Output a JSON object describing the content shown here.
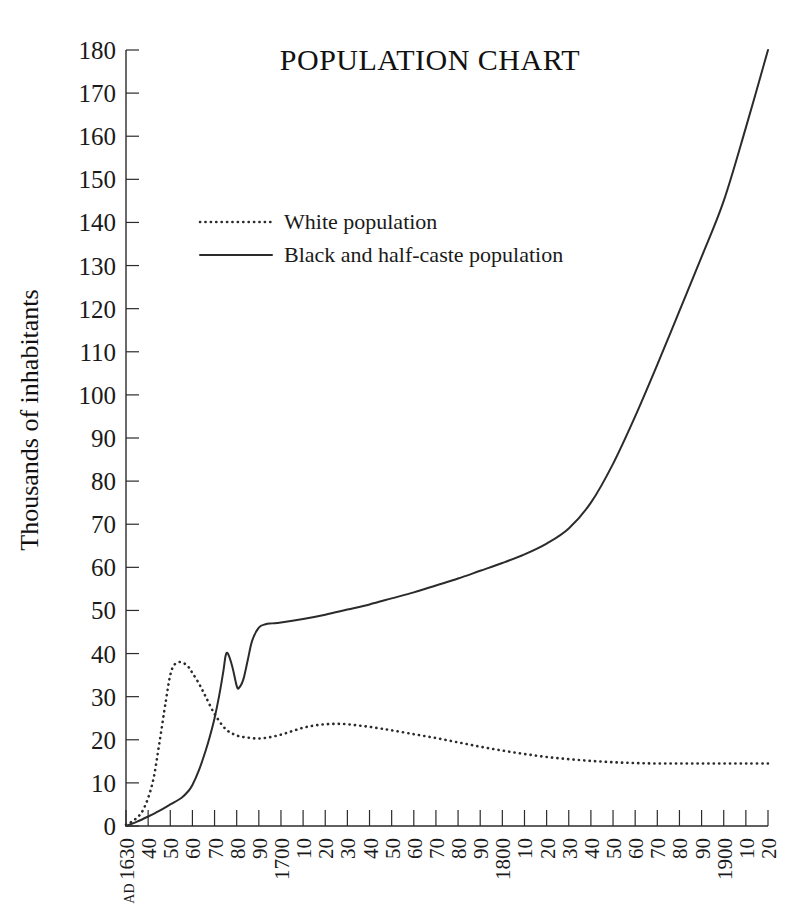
{
  "chart_data": {
    "type": "line",
    "title": "POPULATION CHART",
    "xlabel": "",
    "ylabel": "Thousands of inhabitants",
    "ylim": [
      0,
      180
    ],
    "xlim": [
      1630,
      1920
    ],
    "ytick_step": 10,
    "xtick_step": 10,
    "grid": false,
    "legend_position": "upper-left-inside",
    "yticks": [
      0,
      10,
      20,
      30,
      40,
      50,
      60,
      70,
      80,
      90,
      100,
      110,
      120,
      130,
      140,
      150,
      160,
      170,
      180
    ],
    "xticks": [
      1630,
      1640,
      1650,
      1660,
      1670,
      1680,
      1690,
      1700,
      1710,
      1720,
      1730,
      1740,
      1750,
      1760,
      1770,
      1780,
      1790,
      1800,
      1810,
      1820,
      1830,
      1840,
      1850,
      1860,
      1870,
      1880,
      1890,
      1900,
      1910,
      1920
    ],
    "xtick_labels": [
      "AD 1630",
      "40",
      "50",
      "60",
      "70",
      "80",
      "90",
      "1700",
      "10",
      "20",
      "30",
      "40",
      "50",
      "60",
      "70",
      "80",
      "90",
      "1800",
      "10",
      "20",
      "30",
      "40",
      "50",
      "60",
      "70",
      "80",
      "90",
      "1900",
      "10",
      "20"
    ],
    "series": [
      {
        "name": "White population",
        "style": "dotted",
        "color": "#2b2b2b",
        "x": [
          1630,
          1634,
          1638,
          1642,
          1645,
          1648,
          1650,
          1652,
          1655,
          1658,
          1660,
          1663,
          1666,
          1670,
          1675,
          1680,
          1685,
          1690,
          1695,
          1700,
          1705,
          1710,
          1715,
          1720,
          1725,
          1730,
          1735,
          1740,
          1745,
          1750,
          1760,
          1770,
          1780,
          1790,
          1800,
          1810,
          1820,
          1830,
          1840,
          1850,
          1860,
          1870,
          1880,
          1890,
          1900,
          1910,
          1920
        ],
        "y": [
          0.3,
          1.5,
          4.0,
          10.0,
          19.0,
          29.0,
          35.0,
          37.5,
          38.0,
          37.0,
          35.5,
          33.0,
          30.0,
          26.0,
          22.5,
          21.0,
          20.5,
          20.3,
          20.6,
          21.2,
          22.0,
          22.8,
          23.3,
          23.6,
          23.7,
          23.6,
          23.3,
          23.0,
          22.6,
          22.2,
          21.3,
          20.4,
          19.4,
          18.4,
          17.5,
          16.7,
          16.0,
          15.5,
          15.1,
          14.8,
          14.6,
          14.5,
          14.5,
          14.5,
          14.5,
          14.5,
          14.5
        ]
      },
      {
        "name": "Black and half-caste population",
        "style": "solid",
        "color": "#2b2b2b",
        "x": [
          1630,
          1635,
          1640,
          1645,
          1650,
          1655,
          1658,
          1660,
          1663,
          1666,
          1668,
          1670,
          1672,
          1674,
          1675,
          1676,
          1678,
          1680,
          1681,
          1683,
          1685,
          1687,
          1690,
          1693,
          1696,
          1700,
          1710,
          1720,
          1730,
          1740,
          1750,
          1760,
          1770,
          1780,
          1790,
          1800,
          1810,
          1820,
          1830,
          1840,
          1850,
          1860,
          1870,
          1880,
          1890,
          1900,
          1910,
          1920
        ],
        "y": [
          0.0,
          1.0,
          2.2,
          3.5,
          5.0,
          6.5,
          8.0,
          9.5,
          13.0,
          17.5,
          21.0,
          25.0,
          30.0,
          36.0,
          39.5,
          40.0,
          37.0,
          32.5,
          32.0,
          34.0,
          38.5,
          43.0,
          46.0,
          46.8,
          47.0,
          47.2,
          48.0,
          49.0,
          50.2,
          51.4,
          52.8,
          54.2,
          55.8,
          57.4,
          59.2,
          61.0,
          63.0,
          65.5,
          69.0,
          75.0,
          84.0,
          95.0,
          107.0,
          119.5,
          132.0,
          145.0,
          162.0,
          180.0
        ]
      }
    ]
  },
  "legend": {
    "items": [
      {
        "label": "White population",
        "style": "dotted"
      },
      {
        "label": "Black and half-caste population",
        "style": "solid"
      }
    ]
  },
  "axis_label": {
    "y": "Thousands of inhabitants"
  },
  "ad_marker": "AD"
}
